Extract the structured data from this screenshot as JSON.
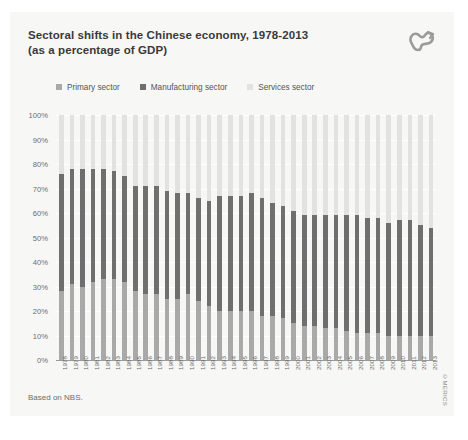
{
  "card": {
    "title_line1": "Sectoral shifts in the Chinese economy, 1978-2013",
    "title_line2": "(as a percentage of GDP)",
    "logo_name": "merics-logo-icon",
    "source_note": "Based on NBS.",
    "credit": "©MERICS"
  },
  "legend": {
    "items": [
      {
        "label": "Primary sector",
        "color": "#a9a9a9"
      },
      {
        "label": "Manufacturing sector",
        "color": "#6f6f6f"
      },
      {
        "label": "Services sector",
        "color": "#e2e2e0"
      }
    ]
  },
  "colors": {
    "primary": "#a9a9a9",
    "manufacturing": "#6f6f6f",
    "services": "#e2e2e0",
    "gridline": "#ffffff",
    "axis": "#9a9a9a",
    "card_bg": "#f7f7f5",
    "title_text": "#3a3a3a",
    "tick_text": "#6d6d6d"
  },
  "chart_data": {
    "type": "bar",
    "stacked": true,
    "title": "Sectoral shifts in the Chinese economy, 1978-2013 (as a percentage of GDP)",
    "xlabel": "",
    "ylabel": "",
    "ylim": [
      0,
      100
    ],
    "yticks": [
      "0%",
      "10%",
      "20%",
      "30%",
      "40%",
      "50%",
      "60%",
      "70%",
      "80%",
      "90%",
      "100%"
    ],
    "ytick_values": [
      0,
      10,
      20,
      30,
      40,
      50,
      60,
      70,
      80,
      90,
      100
    ],
    "grid": true,
    "legend_position": "top",
    "categories": [
      "1978",
      "1979",
      "1980",
      "1981",
      "1982",
      "1983",
      "1984",
      "1985",
      "1986",
      "1987",
      "1988",
      "1989",
      "1990",
      "1991",
      "1992",
      "1993",
      "1994",
      "1995",
      "1996",
      "1997",
      "1998",
      "1999",
      "2000",
      "2001",
      "2002",
      "2003",
      "2004",
      "2005",
      "2006",
      "2007",
      "2008",
      "2009",
      "2010",
      "2011",
      "2012",
      "2013"
    ],
    "series": [
      {
        "name": "Primary sector",
        "color": "#a9a9a9",
        "values": [
          28,
          31,
          30,
          32,
          33,
          33,
          32,
          28,
          27,
          27,
          25,
          25,
          27,
          24,
          22,
          20,
          20,
          20,
          20,
          18,
          18,
          17,
          15,
          14,
          14,
          13,
          13,
          12,
          11,
          11,
          11,
          10,
          10,
          10,
          10,
          10
        ]
      },
      {
        "name": "Manufacturing sector",
        "color": "#6f6f6f",
        "values": [
          48,
          47,
          48,
          46,
          45,
          44,
          43,
          43,
          44,
          44,
          44,
          43,
          41,
          42,
          43,
          47,
          47,
          47,
          48,
          48,
          46,
          46,
          46,
          45,
          45,
          46,
          46,
          47,
          48,
          47,
          47,
          46,
          47,
          47,
          45,
          44
        ]
      },
      {
        "name": "Services sector",
        "color": "#e2e2e0",
        "values": [
          24,
          22,
          22,
          22,
          22,
          23,
          25,
          29,
          29,
          29,
          31,
          32,
          32,
          34,
          35,
          33,
          33,
          33,
          32,
          34,
          36,
          37,
          39,
          41,
          41,
          41,
          41,
          41,
          41,
          42,
          42,
          44,
          43,
          43,
          45,
          46
        ]
      }
    ],
    "cumulative_primary_plus_manufacturing": [
      76,
      78,
      78,
      78,
      78,
      77,
      75,
      71,
      71,
      71,
      69,
      68,
      68,
      66,
      65,
      67,
      67,
      67,
      68,
      66,
      64,
      63,
      61,
      59,
      59,
      59,
      59,
      59,
      59,
      58,
      58,
      56,
      57,
      57,
      55,
      54
    ]
  }
}
